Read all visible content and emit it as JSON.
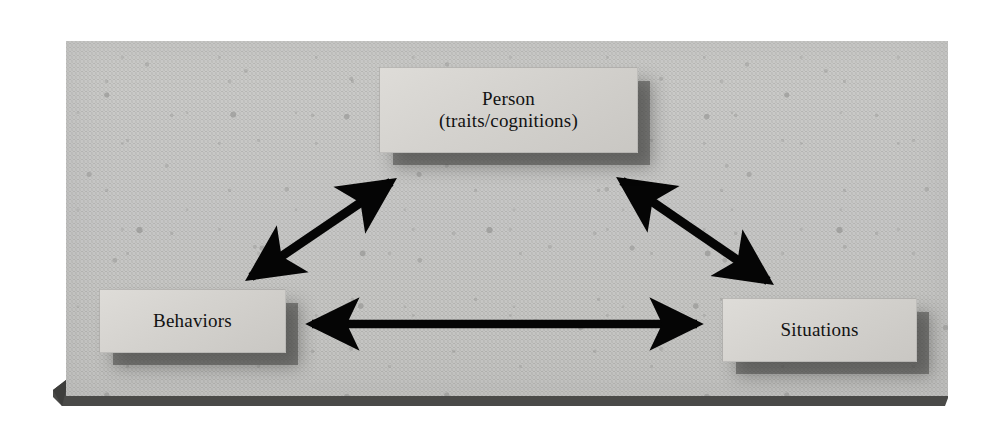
{
  "figure": {
    "background_color": "#ffffff",
    "panel_color": "#b7b7b5",
    "panel_base_color": "#4a4a48",
    "box_fill_color": "#d6d4d0",
    "arrow_color": "#000000",
    "text_color": "#121212"
  },
  "nodes": [
    {
      "id": "person",
      "line1": "Person",
      "line2": "(traits/cognitions)",
      "position": "top-center"
    },
    {
      "id": "behaviors",
      "line1": "Behaviors",
      "line2": "",
      "position": "bottom-left"
    },
    {
      "id": "situations",
      "line1": "Situations",
      "line2": "",
      "position": "bottom-right"
    }
  ],
  "arrows": [
    {
      "id": "behaviors-person",
      "from": "Behaviors",
      "to": "Person",
      "style": "double-headed",
      "orientation": "diagonal-up-right"
    },
    {
      "id": "person-situations",
      "from": "Person",
      "to": "Situations",
      "style": "double-headed",
      "orientation": "diagonal-down-right"
    },
    {
      "id": "behaviors-situations",
      "from": "Behaviors",
      "to": "Situations",
      "style": "double-headed",
      "orientation": "horizontal"
    }
  ]
}
